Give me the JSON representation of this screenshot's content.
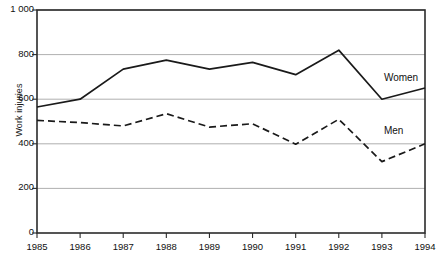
{
  "chart_data": {
    "type": "line",
    "title": "",
    "xlabel": "",
    "ylabel": "Work injuries",
    "categories": [
      1985,
      1986,
      1987,
      1988,
      1989,
      1990,
      1991,
      1992,
      1993,
      1994
    ],
    "x_tick_labels": [
      "1985",
      "1986",
      "1987",
      "1988",
      "1989",
      "1990",
      "1991",
      "1992",
      "1993",
      "1994"
    ],
    "y_tick_labels": [
      "1 000",
      "800",
      "600",
      "400",
      "200",
      "0"
    ],
    "y_tick_values": [
      1000,
      800,
      600,
      400,
      200,
      0
    ],
    "ylim": [
      0,
      1000
    ],
    "grid": "horizontal",
    "legend": "inline-labels",
    "series": [
      {
        "name": "Women",
        "style": "solid",
        "color": "#1a1a1a",
        "values": [
          565,
          600,
          735,
          775,
          735,
          765,
          710,
          820,
          600,
          650
        ]
      },
      {
        "name": "Men",
        "style": "dashed",
        "color": "#1a1a1a",
        "values": [
          505,
          495,
          480,
          535,
          475,
          490,
          398,
          510,
          320,
          400
        ]
      }
    ],
    "annotations": [
      {
        "text": "Women",
        "x": 1993,
        "y": 690
      },
      {
        "text": "Men",
        "x": 1993,
        "y": 455
      }
    ]
  }
}
